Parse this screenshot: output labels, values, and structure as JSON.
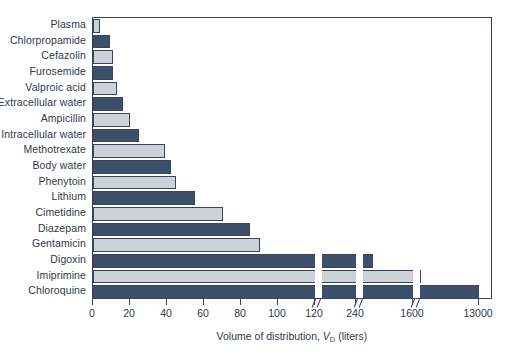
{
  "chart_data": {
    "type": "bar",
    "orientation": "horizontal",
    "title": "",
    "xlabel": "Volume of distribution, V_D (liters)",
    "ylabel": "",
    "grid": false,
    "legend": null,
    "categories": [
      "Plasma",
      "Chlorpropamide",
      "Cefazolin",
      "Furosemide",
      "Valproic acid",
      "Extracellular water",
      "Ampicillin",
      "Intracellular water",
      "Methotrexate",
      "Body water",
      "Phenytoin",
      "Lithium",
      "Cimetidine",
      "Diazepam",
      "Gentamicin",
      "Digoxin",
      "Imiprimine",
      "Chloroquine"
    ],
    "values": [
      4,
      9,
      11,
      11,
      13,
      16,
      20,
      25,
      39,
      42,
      45,
      55,
      70,
      85,
      90,
      500,
      1700,
      13000
    ],
    "value_unit": "liters",
    "xticks": [
      0,
      20,
      40,
      60,
      80,
      100,
      120,
      240,
      1600,
      13000
    ],
    "xtick_labels": [
      "0",
      "20",
      "40",
      "60",
      "80",
      "100",
      "120",
      "240",
      "1600",
      "13000"
    ],
    "axis_breaks": [
      180,
      400,
      4000
    ],
    "xlim": [
      0,
      13000
    ],
    "bar_colors": [
      "#ccd3d8",
      "#3d4f6b"
    ],
    "bar_border_color": "#39445c"
  },
  "axis": {
    "x_title_main": "Volume of distribution, ",
    "x_title_symbol": "V",
    "x_title_sub": "D",
    "x_title_tail": " (liters)"
  },
  "colors": {
    "dark_bar": "#3d4f6b",
    "light_bar": "#ccd3d8",
    "frame": "#3a4256",
    "text": "#2f3848",
    "background": "#ffffff"
  }
}
